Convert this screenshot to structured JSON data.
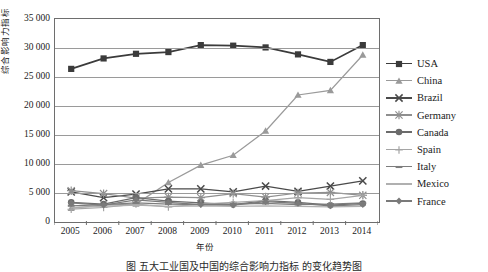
{
  "chart_data": {
    "type": "line",
    "title": "",
    "xlabel": "年份",
    "ylabel": "综合影响力指标",
    "categories": [
      2005,
      2006,
      2007,
      2008,
      2009,
      2010,
      2011,
      2012,
      2013,
      2014
    ],
    "xtick_labels": [
      "2005",
      "2006",
      "2007",
      "2008",
      "2009",
      "2010",
      "2011",
      "2012",
      "2013",
      "2014"
    ],
    "ytick_labels": [
      "0",
      "5 000",
      "10 000",
      "15 000",
      "20 000",
      "25 000",
      "30 000",
      "35 000"
    ],
    "ytick_values": [
      0,
      5000,
      10000,
      15000,
      20000,
      25000,
      30000,
      35000
    ],
    "ylim": [
      0,
      35000
    ],
    "grid": true,
    "legend_position": "right",
    "series": [
      {
        "name": "USA",
        "marker": "square",
        "color": "#3b3b3b",
        "values": [
          26400,
          28200,
          29000,
          29300,
          30500,
          30400,
          30100,
          28900,
          27600,
          30500
        ]
      },
      {
        "name": "China",
        "marker": "triangle",
        "color": "#9a9a9a",
        "values": [
          2400,
          2900,
          3100,
          6800,
          9800,
          11500,
          15700,
          21900,
          22700,
          28800
        ]
      },
      {
        "name": "Brazil",
        "marker": "x",
        "color": "#4a4a4a",
        "values": [
          5200,
          4200,
          4800,
          5700,
          5700,
          5200,
          6200,
          5300,
          6200,
          7100
        ]
      },
      {
        "name": "Germany",
        "marker": "star",
        "color": "#8f8f8f",
        "values": [
          5400,
          4900,
          4100,
          4300,
          4200,
          4900,
          4300,
          5000,
          5100,
          4600
        ]
      },
      {
        "name": "Canada",
        "marker": "circle",
        "color": "#6b6b6b",
        "values": [
          3400,
          3100,
          4200,
          3600,
          3300,
          3000,
          3700,
          3400,
          2900,
          3200
        ]
      },
      {
        "name": "Spain",
        "marker": "plus",
        "color": "#a5a5a5",
        "values": [
          2200,
          2500,
          3100,
          2600,
          3100,
          3400,
          3700,
          4200,
          3900,
          4600
        ]
      },
      {
        "name": "Italy",
        "marker": "dash",
        "color": "#7d7d7d",
        "values": [
          2800,
          3000,
          3300,
          3100,
          3000,
          3100,
          3200,
          3000,
          3100,
          3300
        ]
      },
      {
        "name": "Mexico",
        "marker": "none",
        "color": "#b0b0b0",
        "values": [
          2500,
          2700,
          2900,
          2700,
          2800,
          2700,
          2800,
          2700,
          2600,
          2700
        ]
      },
      {
        "name": "France",
        "marker": "diamond",
        "color": "#7a7a7a",
        "values": [
          3300,
          2900,
          3800,
          3400,
          3000,
          2900,
          3500,
          3200,
          2800,
          3000
        ]
      }
    ]
  },
  "caption": "图   五大工业国及中国的综合影响力指标    的变化趋势图"
}
